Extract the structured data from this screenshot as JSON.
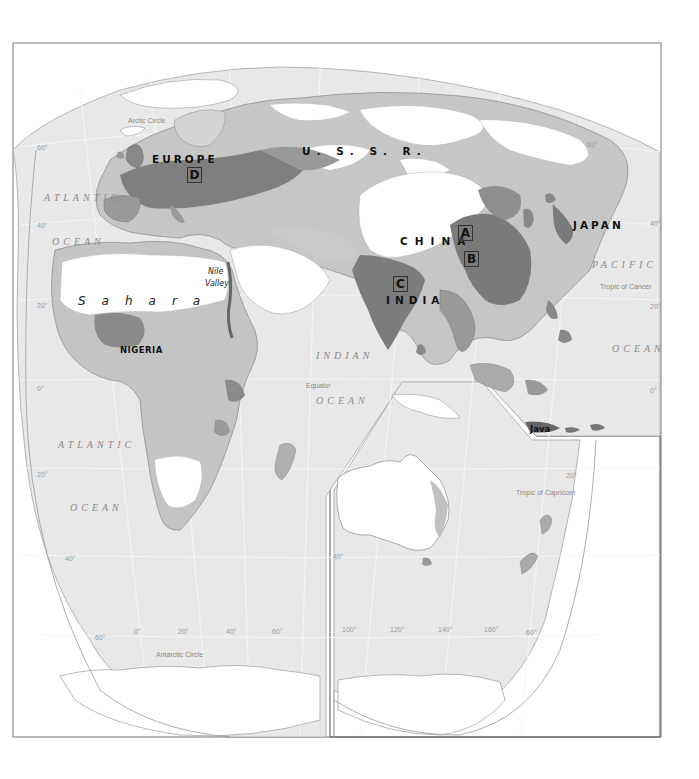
{
  "map": {
    "title": "",
    "region_labels": {
      "europe": "EUROPE",
      "ussr": "U. S. S. R.",
      "china": "CHINA",
      "japan": "JAPAN",
      "india": "INDIA",
      "nigeria": "NIGERIA",
      "sahara": "Sahara",
      "nile_line1": "Nile",
      "nile_line2": "Valley",
      "java": "Java"
    },
    "marker_boxes": {
      "a": "A",
      "b": "B",
      "c": "C",
      "d": "D"
    },
    "ocean_labels": {
      "atlantic_north_1": "ATLANTIC",
      "atlantic_north_2": "OCEAN",
      "atlantic_south_1": "ATLANTIC",
      "atlantic_south_2": "OCEAN",
      "indian_1": "INDIAN",
      "indian_2": "OCEAN",
      "pacific_1": "PACIFIC",
      "pacific_2": "OCEAN"
    },
    "reference_lines": {
      "arctic_circle": "Arctic Circle",
      "tropic_cancer": "Tropic of Cancer",
      "equator": "Equator",
      "tropic_capricorn": "Tropic of Capricorn",
      "antarctic_circle": "Antarctic Circle"
    },
    "latitude_ticks": {
      "left_60n": "60°",
      "left_40n": "40°",
      "left_20n": "20°",
      "left_0": "0°",
      "left_20s": "20°",
      "left_40s": "40°",
      "left_60s": "60°",
      "right_60n": "60°",
      "right_40n": "40°",
      "right_20n": "20°",
      "right_0": "0°",
      "right_20s": "20°",
      "inset_40s": "40°",
      "inset_60s": "60°"
    },
    "longitude_ticks": [
      "0°",
      "20°",
      "40°",
      "60°",
      "100°",
      "120°",
      "140°",
      "160°"
    ],
    "colors": {
      "ocean": "#e6e6e6",
      "land_low": "#ffffff",
      "density_1": "#c9c9c9",
      "density_2": "#a9a9a9",
      "density_3": "#8a8a8a",
      "density_4": "#6e6e6e",
      "frame": "#555555"
    }
  }
}
